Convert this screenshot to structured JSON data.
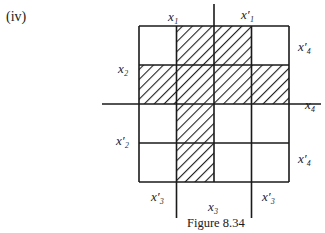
{
  "part_label": "(iv)",
  "caption": "Figure 8.34",
  "grid": {
    "rows": 4,
    "cols": 4,
    "left": 139,
    "top": 26,
    "cell_w": 37.5,
    "cell_h": 39,
    "shaded_cells": [
      [
        0,
        1
      ],
      [
        0,
        2
      ],
      [
        1,
        0
      ],
      [
        1,
        1
      ],
      [
        1,
        2
      ],
      [
        1,
        3
      ],
      [
        2,
        1
      ],
      [
        3,
        1
      ]
    ]
  },
  "labels": {
    "top_left": "x₁",
    "top_right": "x′₁",
    "left_row1": "x₂",
    "left_row3": "x′₂",
    "right_row0": "x′₄",
    "right_row1_2": "x₄",
    "right_row3": "x′₄",
    "bottom_col0": "x′₃",
    "bottom_mid": "x₃",
    "bottom_col3": "x′₃"
  }
}
